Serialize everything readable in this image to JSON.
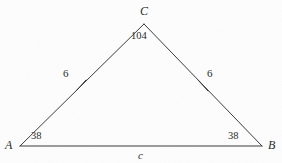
{
  "figure": {
    "kind": "geometry-diagram",
    "shape": "triangle",
    "stroke_color": "#3a3a3a",
    "text_color": "#2a2a2a",
    "background_color": "#fdfdfd"
  },
  "vertices": {
    "A": {
      "label": "A",
      "x": 20,
      "y": 146,
      "label_x": 5,
      "label_y": 139
    },
    "B": {
      "label": "B",
      "x": 262,
      "y": 146,
      "label_x": 268,
      "label_y": 139
    },
    "C": {
      "label": "C",
      "x": 144,
      "y": 24,
      "label_x": 140,
      "label_y": 5
    }
  },
  "angles": [
    {
      "at": "A",
      "value": "38",
      "x": 31,
      "y": 131
    },
    {
      "at": "B",
      "value": "38",
      "x": 228,
      "y": 131
    },
    {
      "at": "C",
      "value": "104",
      "x": 131,
      "y": 31
    }
  ],
  "sides": [
    {
      "name": "AC",
      "label": "6",
      "label_x": 63,
      "label_y": 68,
      "tick_marks": 1,
      "tick_x": 81,
      "tick_y": 85
    },
    {
      "name": "BC",
      "label": "6",
      "label_x": 207,
      "label_y": 68,
      "tick_marks": 1,
      "tick_x": 203,
      "tick_y": 85
    },
    {
      "name": "AB",
      "label": "c",
      "label_x": 138,
      "label_y": 150,
      "tick_marks": 0
    }
  ]
}
